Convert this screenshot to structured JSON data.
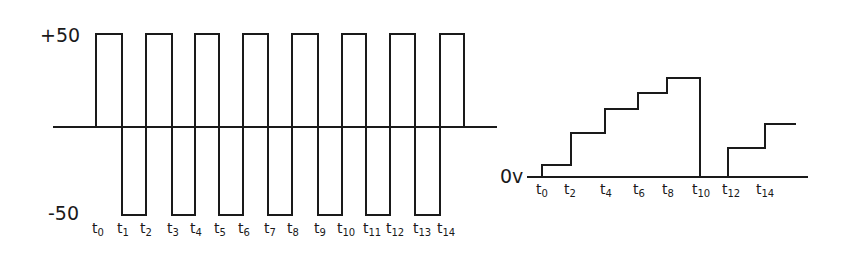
{
  "diagram": {
    "left_panel": {
      "title": "Square wave input",
      "y_labels": {
        "top": "+50",
        "bottom": "-50"
      },
      "time_labels": [
        "t0",
        "t1",
        "t2",
        "t3",
        "t4",
        "t5",
        "t6",
        "t7",
        "t8",
        "t9",
        "t10",
        "t11",
        "t12",
        "t13",
        "t14"
      ],
      "time_label_parts": [
        {
          "base": "t",
          "sub": "0"
        },
        {
          "base": "t",
          "sub": "1"
        },
        {
          "base": "t",
          "sub": "2"
        },
        {
          "base": "t",
          "sub": "3"
        },
        {
          "base": "t",
          "sub": "4"
        },
        {
          "base": "t",
          "sub": "5"
        },
        {
          "base": "t",
          "sub": "6"
        },
        {
          "base": "t",
          "sub": "7"
        },
        {
          "base": "t",
          "sub": "8"
        },
        {
          "base": "t",
          "sub": "9"
        },
        {
          "base": "t",
          "sub": "10"
        },
        {
          "base": "t",
          "sub": "11"
        },
        {
          "base": "t",
          "sub": "12"
        },
        {
          "base": "t",
          "sub": "13"
        },
        {
          "base": "t",
          "sub": "14"
        }
      ],
      "levels": [
        50,
        -50,
        50,
        -50,
        50,
        -50,
        50,
        -50,
        50,
        -50,
        50,
        -50,
        50,
        -50,
        50
      ]
    },
    "right_panel": {
      "title": "Staircase output",
      "y_label": "0v",
      "time_label_parts": [
        {
          "base": "t",
          "sub": "0"
        },
        {
          "base": "t",
          "sub": "2"
        },
        {
          "base": "t",
          "sub": "4"
        },
        {
          "base": "t",
          "sub": "6"
        },
        {
          "base": "t",
          "sub": "8"
        },
        {
          "base": "t",
          "sub": "10"
        },
        {
          "base": "t",
          "sub": "12"
        },
        {
          "base": "t",
          "sub": "14"
        }
      ],
      "step_levels": [
        1,
        2,
        3,
        4,
        5,
        0,
        1,
        2
      ]
    }
  }
}
